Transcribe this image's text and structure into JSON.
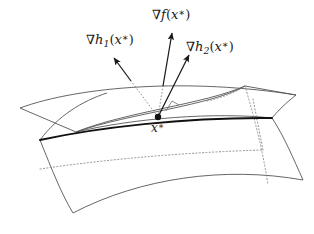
{
  "figure": {
    "background_color": "#ffffff",
    "line_color": "#4d4d4d",
    "bold_line_color": "#111111",
    "arrow_color": "#1a1a1a",
    "dotted_color": "#777777",
    "labels": {
      "grad_f": {
        "nabla": "∇",
        "fn": "f",
        "open": "(",
        "var": "x",
        "star": "∗",
        "close": ")",
        "text": "∇f(x∗)"
      },
      "grad_h1": {
        "nabla": "∇",
        "fn": "h",
        "sub": "1",
        "open": "(",
        "var": "x",
        "star": "∗",
        "close": ")",
        "text": "∇h₁(x∗)"
      },
      "grad_h2": {
        "nabla": "∇",
        "fn": "h",
        "sub": "2",
        "open": "(",
        "var": "x",
        "star": "∗",
        "close": ")",
        "text": "∇h₂(x∗)"
      },
      "x_star": {
        "var": "x",
        "star": "∗",
        "text": "x∗"
      }
    },
    "elements": {
      "point_x_star": {
        "x": 158,
        "y": 117,
        "radius": 3.2
      },
      "right_angle_marker": {
        "x": 170,
        "y": 108,
        "size": 8
      },
      "arrow_grad_f": {
        "from_x": 158,
        "from_y": 117,
        "to_x": 173,
        "to_y": 31
      },
      "arrow_grad_h1": {
        "from_x": 158,
        "from_y": 117,
        "to_x": 112,
        "to_y": 56
      },
      "arrow_grad_h2": {
        "from_x": 158,
        "from_y": 117,
        "to_x": 191,
        "to_y": 53
      }
    }
  }
}
